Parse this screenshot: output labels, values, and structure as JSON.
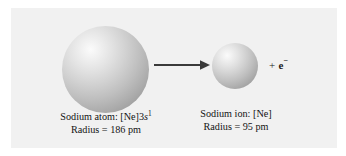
{
  "figure": {
    "background_color": "#ffffff",
    "panel_color": "#f1f1f1"
  },
  "reactant": {
    "species_name": "sodium-atom",
    "sphere_label": "sodium atom sphere",
    "diameter_px": 87,
    "caption_line1_prefix": "Sodium atom: [Ne]3",
    "caption_line1_orbital": "s",
    "caption_line1_superscript": "1",
    "caption_line2": "Radius = 186 pm",
    "radius_value": "186",
    "radius_unit": "pm",
    "electron_configuration": "[Ne]3s1"
  },
  "product": {
    "species_name": "sodium-ion",
    "sphere_label": "sodium ion sphere",
    "diameter_px": 46,
    "caption_line1": "Sodium ion: [Ne]",
    "caption_line2": "Radius = 95 pm",
    "radius_value": "95",
    "radius_unit": "pm",
    "electron_configuration": "[Ne]"
  },
  "arrow": {
    "direction": "right",
    "color": "#3a3a3a"
  },
  "electron": {
    "plus_sign": "+",
    "symbol": "e",
    "charge": "−"
  },
  "sphere_style": {
    "highlight_color": "#fbfbfb",
    "mid_color": "#c2c2c2",
    "shadow_color": "#8a8a8a"
  }
}
